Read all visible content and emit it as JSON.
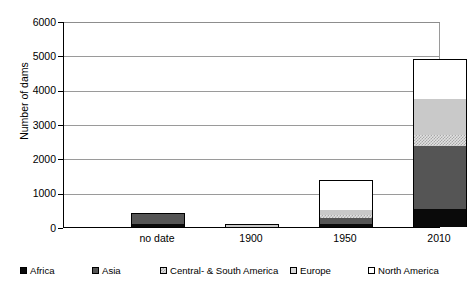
{
  "chart_data": {
    "type": "bar",
    "stacked": true,
    "title": "",
    "xlabel": "",
    "ylabel": "Number of dams",
    "ylim": [
      0,
      6000
    ],
    "ytick_values": [
      0,
      1000,
      2000,
      3000,
      4000,
      5000,
      6000
    ],
    "ytick_labels": [
      "0",
      "1000",
      "2000",
      "3000",
      "4000",
      "5000",
      "6000"
    ],
    "grid": "horizontal",
    "legend_position": "bottom",
    "categories": [
      "no date",
      "1900",
      "1950",
      "2010"
    ],
    "series": [
      {
        "name": "Africa",
        "color": "#0a0a0a",
        "pattern": "solid-black",
        "values": [
          80,
          0,
          90,
          520
        ]
      },
      {
        "name": "Asia",
        "color": "#555555",
        "pattern": "solid-gray",
        "values": [
          290,
          10,
          180,
          1830
        ]
      },
      {
        "name": "Central- & South America",
        "color": "#e2e2e2",
        "pattern": "checkered",
        "values": [
          15,
          5,
          70,
          330
        ]
      },
      {
        "name": "Europe",
        "color": "#c9c9c9",
        "pattern": "light-gray",
        "values": [
          0,
          40,
          160,
          1050
        ]
      },
      {
        "name": "North America",
        "color": "#ffffff",
        "pattern": "white",
        "values": [
          10,
          45,
          870,
          1150
        ]
      }
    ],
    "totals": [
      395,
      100,
      1370,
      4880
    ]
  },
  "legend": {
    "items": [
      {
        "label": "Africa",
        "swatch": "africa-swatch"
      },
      {
        "label": "Asia",
        "swatch": "asia-swatch"
      },
      {
        "label": "Central- & South America",
        "swatch": "central-south-america-swatch"
      },
      {
        "label": "Europe",
        "swatch": "europe-swatch"
      },
      {
        "label": "North America",
        "swatch": "north-america-swatch"
      }
    ]
  }
}
